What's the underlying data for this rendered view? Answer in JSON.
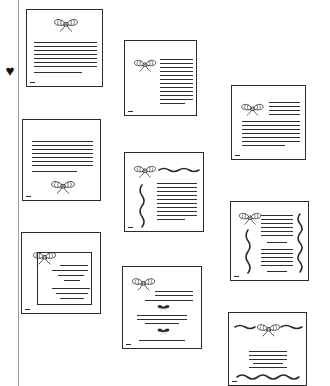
{
  "canvas": {
    "width": 330,
    "height": 386,
    "background": "#ffffff",
    "ink_color": "#2b2b2b",
    "rule_color": "#2f2f2f",
    "guide_color": "#9a9a9a"
  },
  "left_rail": {
    "name": "vertical-guide-rail",
    "x": 18,
    "top": 0,
    "height": 386
  },
  "heart_marker": {
    "glyph": "♥",
    "x": 3,
    "y": 64,
    "color": "#111111"
  },
  "documents": [
    {
      "id": "doc-1",
      "label": "bow-top-centered-lines",
      "x": 26,
      "y": 9,
      "w": 77,
      "h": 78,
      "bow": {
        "x": 26,
        "y": 6,
        "w": 26,
        "h": 16,
        "style": "outline"
      },
      "lines": [
        {
          "x": 7,
          "y": 32,
          "w": 63
        },
        {
          "x": 7,
          "y": 36,
          "w": 63
        },
        {
          "x": 7,
          "y": 40,
          "w": 63
        },
        {
          "x": 7,
          "y": 44,
          "w": 63
        },
        {
          "x": 7,
          "y": 48,
          "w": 63
        },
        {
          "x": 7,
          "y": 52,
          "w": 63
        },
        {
          "x": 7,
          "y": 56,
          "w": 63
        },
        {
          "x": 7,
          "y": 62,
          "w": 48
        }
      ],
      "waves": [],
      "inner_frame": null,
      "extra_bows": []
    },
    {
      "id": "doc-2",
      "label": "bow-left-lines-right",
      "x": 124,
      "y": 40,
      "w": 73,
      "h": 76,
      "bow": {
        "x": 8,
        "y": 16,
        "w": 24,
        "h": 15,
        "style": "outline"
      },
      "lines": [
        {
          "x": 35,
          "y": 18,
          "w": 33
        },
        {
          "x": 35,
          "y": 22,
          "w": 33
        },
        {
          "x": 35,
          "y": 26,
          "w": 33
        },
        {
          "x": 35,
          "y": 30,
          "w": 33
        },
        {
          "x": 35,
          "y": 34,
          "w": 33
        },
        {
          "x": 35,
          "y": 38,
          "w": 33
        },
        {
          "x": 35,
          "y": 42,
          "w": 33
        },
        {
          "x": 35,
          "y": 46,
          "w": 33
        },
        {
          "x": 35,
          "y": 50,
          "w": 33
        },
        {
          "x": 35,
          "y": 54,
          "w": 33
        },
        {
          "x": 35,
          "y": 58,
          "w": 33
        },
        {
          "x": 35,
          "y": 62,
          "w": 25
        }
      ],
      "waves": [],
      "inner_frame": null,
      "extra_bows": []
    },
    {
      "id": "doc-3",
      "label": "bow-left-header-then-full-lines",
      "x": 231,
      "y": 85,
      "w": 75,
      "h": 75,
      "bow": {
        "x": 8,
        "y": 15,
        "w": 25,
        "h": 15,
        "style": "outline"
      },
      "lines": [
        {
          "x": 37,
          "y": 16,
          "w": 31
        },
        {
          "x": 37,
          "y": 20,
          "w": 31
        },
        {
          "x": 37,
          "y": 24,
          "w": 31
        },
        {
          "x": 37,
          "y": 28,
          "w": 31
        },
        {
          "x": 10,
          "y": 35,
          "w": 58
        },
        {
          "x": 10,
          "y": 39,
          "w": 58
        },
        {
          "x": 10,
          "y": 43,
          "w": 58
        },
        {
          "x": 10,
          "y": 47,
          "w": 58
        },
        {
          "x": 10,
          "y": 51,
          "w": 58
        },
        {
          "x": 10,
          "y": 55,
          "w": 58
        },
        {
          "x": 10,
          "y": 59,
          "w": 43
        }
      ],
      "waves": [],
      "inner_frame": null,
      "extra_bows": []
    },
    {
      "id": "doc-4",
      "label": "lines-top-bow-bottom",
      "x": 22,
      "y": 119,
      "w": 79,
      "h": 82,
      "bow": {
        "x": 27,
        "y": 58,
        "w": 26,
        "h": 16,
        "style": "outline"
      },
      "lines": [
        {
          "x": 9,
          "y": 21,
          "w": 61
        },
        {
          "x": 9,
          "y": 25,
          "w": 61
        },
        {
          "x": 9,
          "y": 29,
          "w": 61
        },
        {
          "x": 9,
          "y": 33,
          "w": 61
        },
        {
          "x": 9,
          "y": 37,
          "w": 61
        },
        {
          "x": 9,
          "y": 41,
          "w": 61
        },
        {
          "x": 9,
          "y": 45,
          "w": 61
        },
        {
          "x": 9,
          "y": 51,
          "w": 45
        }
      ],
      "waves": [],
      "inner_frame": null,
      "extra_bows": []
    },
    {
      "id": "doc-5",
      "label": "bow-wave-header-side-wave",
      "x": 124,
      "y": 152,
      "w": 80,
      "h": 80,
      "bow": {
        "x": 8,
        "y": 10,
        "w": 24,
        "h": 15,
        "style": "outline"
      },
      "lines": [
        {
          "x": 32,
          "y": 30,
          "w": 40
        },
        {
          "x": 32,
          "y": 34,
          "w": 40
        },
        {
          "x": 32,
          "y": 38,
          "w": 40
        },
        {
          "x": 32,
          "y": 42,
          "w": 40
        },
        {
          "x": 32,
          "y": 46,
          "w": 40
        },
        {
          "x": 32,
          "y": 50,
          "w": 40
        },
        {
          "x": 32,
          "y": 54,
          "w": 40
        },
        {
          "x": 32,
          "y": 58,
          "w": 40
        },
        {
          "x": 32,
          "y": 62,
          "w": 40
        },
        {
          "x": 32,
          "y": 66,
          "w": 28
        }
      ],
      "waves": [
        {
          "orientation": "horizontal",
          "x": 34,
          "y": 17,
          "len": 40,
          "amp": 3
        },
        {
          "orientation": "vertical",
          "x": 17,
          "y": 32,
          "len": 42,
          "amp": 4
        }
      ],
      "inner_frame": null,
      "extra_bows": []
    },
    {
      "id": "doc-6",
      "label": "bow-twin-vertical-waves",
      "x": 230,
      "y": 201,
      "w": 79,
      "h": 80,
      "bow": {
        "x": 7,
        "y": 8,
        "w": 24,
        "h": 15,
        "style": "outline"
      },
      "lines": [
        {
          "x": 30,
          "y": 13,
          "w": 32
        },
        {
          "x": 30,
          "y": 17,
          "w": 32
        },
        {
          "x": 30,
          "y": 21,
          "w": 32
        },
        {
          "x": 30,
          "y": 25,
          "w": 32
        },
        {
          "x": 30,
          "y": 29,
          "w": 32
        },
        {
          "x": 30,
          "y": 33,
          "w": 32
        },
        {
          "x": 36,
          "y": 40,
          "w": 20
        },
        {
          "x": 30,
          "y": 47,
          "w": 32
        },
        {
          "x": 30,
          "y": 51,
          "w": 32
        },
        {
          "x": 30,
          "y": 55,
          "w": 32
        },
        {
          "x": 30,
          "y": 59,
          "w": 32
        },
        {
          "x": 30,
          "y": 63,
          "w": 32
        },
        {
          "x": 36,
          "y": 69,
          "w": 20
        }
      ],
      "waves": [
        {
          "orientation": "vertical",
          "x": 17,
          "y": 28,
          "len": 43,
          "amp": 4
        },
        {
          "orientation": "vertical",
          "x": 69,
          "y": 12,
          "len": 58,
          "amp": 4
        }
      ],
      "inner_frame": null,
      "extra_bows": []
    },
    {
      "id": "doc-7",
      "label": "inner-frame-bow-corner",
      "x": 21,
      "y": 232,
      "w": 80,
      "h": 82,
      "bow": {
        "x": 10,
        "y": 16,
        "w": 25,
        "h": 16,
        "style": "outline"
      },
      "lines": [
        {
          "x": 38,
          "y": 32,
          "w": 28
        },
        {
          "x": 30,
          "y": 37,
          "w": 36
        },
        {
          "x": 36,
          "y": 42,
          "w": 26
        },
        {
          "x": 42,
          "y": 47,
          "w": 16
        },
        {
          "x": 30,
          "y": 55,
          "w": 38
        },
        {
          "x": 34,
          "y": 60,
          "w": 32
        },
        {
          "x": 38,
          "y": 65,
          "w": 24
        }
      ],
      "waves": [],
      "inner_frame": {
        "x": 15,
        "y": 19,
        "w": 55,
        "h": 53
      },
      "extra_bows": []
    },
    {
      "id": "doc-8",
      "label": "bow-header-two-small-bows",
      "x": 122,
      "y": 266,
      "w": 80,
      "h": 83,
      "bow": {
        "x": 8,
        "y": 8,
        "w": 25,
        "h": 16,
        "style": "outline"
      },
      "lines": [
        {
          "x": 32,
          "y": 24,
          "w": 38
        },
        {
          "x": 32,
          "y": 28,
          "w": 38
        },
        {
          "x": 22,
          "y": 33,
          "w": 48
        },
        {
          "x": 14,
          "y": 48,
          "w": 50
        },
        {
          "x": 14,
          "y": 52,
          "w": 50
        },
        {
          "x": 22,
          "y": 56,
          "w": 34
        },
        {
          "x": 16,
          "y": 73,
          "w": 46
        }
      ],
      "waves": [],
      "inner_frame": null,
      "extra_bows": [
        {
          "x": 34,
          "y": 36,
          "w": 13,
          "h": 9,
          "style": "solid"
        },
        {
          "x": 34,
          "y": 59,
          "w": 13,
          "h": 10,
          "style": "solid"
        }
      ]
    },
    {
      "id": "doc-9",
      "label": "wave-bow-banner-bottom-wave",
      "x": 228,
      "y": 312,
      "w": 79,
      "h": 74,
      "bow": {
        "x": 27,
        "y": 8,
        "w": 25,
        "h": 16,
        "style": "outline"
      },
      "lines": [
        {
          "x": 20,
          "y": 38,
          "w": 38
        },
        {
          "x": 20,
          "y": 42,
          "w": 38
        },
        {
          "x": 20,
          "y": 46,
          "w": 38
        },
        {
          "x": 24,
          "y": 50,
          "w": 30
        },
        {
          "x": 20,
          "y": 54,
          "w": 38
        }
      ],
      "waves": [
        {
          "orientation": "horizontal",
          "x": 6,
          "y": 14,
          "len": 20,
          "amp": 3
        },
        {
          "orientation": "horizontal",
          "x": 52,
          "y": 14,
          "len": 21,
          "amp": 3
        },
        {
          "orientation": "horizontal",
          "x": 8,
          "y": 64,
          "len": 62,
          "amp": 4
        }
      ],
      "inner_frame": null,
      "extra_bows": []
    }
  ]
}
